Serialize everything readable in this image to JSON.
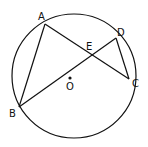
{
  "diagram": {
    "circle": {
      "label": "O",
      "cx": 74,
      "cy": 76,
      "r": 62
    },
    "points": {
      "A": {
        "label": "A",
        "x": 45,
        "y": 24
      },
      "B": {
        "label": "B",
        "x": 19,
        "y": 107
      },
      "C": {
        "label": "C",
        "x": 129,
        "y": 79
      },
      "D": {
        "label": "D",
        "x": 116,
        "y": 38
      },
      "E": {
        "label": "E",
        "x": 92,
        "y": 55
      }
    },
    "segments": [
      "AB",
      "AC",
      "BD",
      "DC"
    ],
    "stroke": "#111111"
  }
}
